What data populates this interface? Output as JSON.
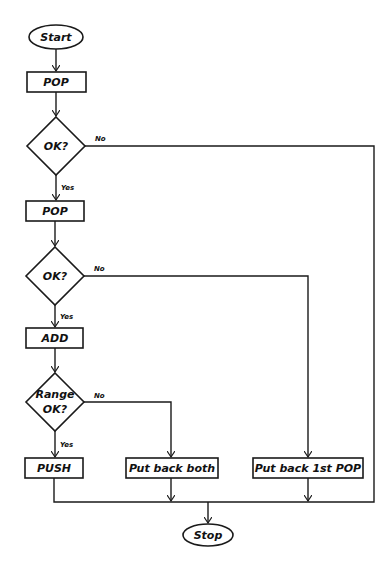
{
  "diagram": {
    "type": "flowchart",
    "nodes": {
      "start": {
        "label": "Start",
        "shape": "terminator"
      },
      "pop1": {
        "label": "POP",
        "shape": "process"
      },
      "ok1": {
        "label": "OK?",
        "shape": "decision"
      },
      "pop2": {
        "label": "POP",
        "shape": "process"
      },
      "ok2": {
        "label": "OK?",
        "shape": "decision"
      },
      "add": {
        "label": "ADD",
        "shape": "process"
      },
      "range_ok": {
        "label_line1": "Range",
        "label_line2": "OK?",
        "shape": "decision"
      },
      "push": {
        "label": "PUSH",
        "shape": "process"
      },
      "put_back_both": {
        "label": "Put back both",
        "shape": "process"
      },
      "put_back_1st": {
        "label": "Put back 1st POP",
        "shape": "process"
      },
      "stop": {
        "label": "Stop",
        "shape": "terminator"
      }
    },
    "edge_labels": {
      "ok1_no": "No",
      "ok1_yes": "Yes",
      "ok2_no": "No",
      "ok2_yes": "Yes",
      "range_no": "No",
      "range_yes": "Yes"
    },
    "edges": [
      {
        "from": "start",
        "to": "pop1"
      },
      {
        "from": "pop1",
        "to": "ok1"
      },
      {
        "from": "ok1",
        "to": "pop2",
        "label": "Yes"
      },
      {
        "from": "ok1",
        "to": "stop",
        "label": "No"
      },
      {
        "from": "pop2",
        "to": "ok2"
      },
      {
        "from": "ok2",
        "to": "add",
        "label": "Yes"
      },
      {
        "from": "ok2",
        "to": "put_back_1st",
        "label": "No"
      },
      {
        "from": "add",
        "to": "range_ok"
      },
      {
        "from": "range_ok",
        "to": "push",
        "label": "Yes"
      },
      {
        "from": "range_ok",
        "to": "put_back_both",
        "label": "No"
      },
      {
        "from": "push",
        "to": "stop"
      },
      {
        "from": "put_back_both",
        "to": "stop"
      },
      {
        "from": "put_back_1st",
        "to": "stop"
      }
    ]
  }
}
